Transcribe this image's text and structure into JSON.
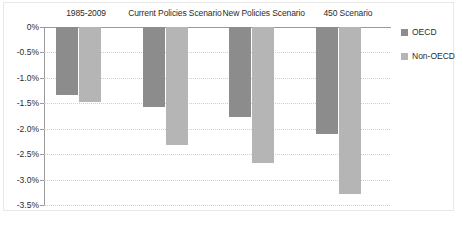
{
  "chart_data": {
    "type": "bar",
    "title": "",
    "subtitle": "",
    "xlabel": "",
    "ylabel": "",
    "categories": [
      "1985-2009",
      "Current Policies Scenario",
      "New Policies Scenario",
      "450 Scenario"
    ],
    "series": [
      {
        "name": "OECD",
        "color": "#8c8c8c",
        "values": [
          -1.33,
          -1.57,
          -1.77,
          -2.1
        ]
      },
      {
        "name": "Non-OECD",
        "color": "#b5b5b5",
        "values": [
          -1.48,
          -2.32,
          -2.67,
          -3.28
        ]
      }
    ],
    "ylim": [
      -3.5,
      0
    ],
    "ytick_values": [
      0,
      -0.5,
      -1.0,
      -1.5,
      -2.0,
      -2.5,
      -3.0,
      -3.5
    ],
    "ytick_labels": [
      "0%",
      "-0.5%",
      "-1.0%",
      "-1.5%",
      "-2.0%",
      "-2.5%",
      "-3.0%",
      "-3.5%"
    ],
    "grid": true,
    "grid_axis": "y",
    "legend_position": "right",
    "bar_orientation": "downward"
  },
  "legend": {
    "entries": [
      {
        "label": "OECD",
        "color": "#8c8c8c"
      },
      {
        "label": "Non-OECD",
        "color": "#b5b5b5"
      }
    ]
  },
  "caption": {
    "text": ""
  },
  "colors": {
    "oecd": "#8c8c8c",
    "non_oecd": "#b5b5b5",
    "axis": "#9a9a9a",
    "gridline": "#cfcfcf",
    "text": "#2b2b2b",
    "background": "#ffffff"
  }
}
